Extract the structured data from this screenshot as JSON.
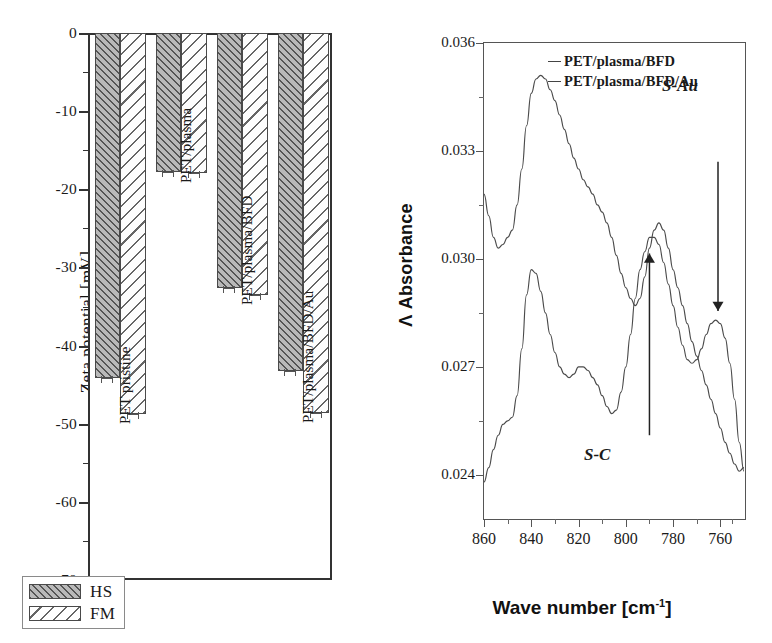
{
  "figure": {
    "panels": [
      "zeta-potential-bar-chart",
      "ftir-absorbance-spectrum"
    ]
  },
  "left_chart": {
    "ylabel": "Zeta potential [mV]",
    "ytick_labels": [
      "0",
      "-10",
      "-20",
      "-30",
      "-40",
      "-50",
      "-60",
      "-70"
    ],
    "legend": [
      {
        "key": "HS",
        "label": "HS",
        "hatch": "dense-45"
      },
      {
        "key": "FM",
        "label": "FM",
        "hatch": "sparse-135"
      }
    ],
    "categories": [
      "PET pristine",
      "PET/plasma",
      "PET/plasma/BFD",
      "PET/plasma/BFD/Au"
    ]
  },
  "right_chart": {
    "ylabel": "Λ Absorbance",
    "xlabel_main": "Wave number [cm",
    "xlabel_sup": "-1",
    "xlabel_tail": "]",
    "ytick_labels": [
      "0.036",
      "0.033",
      "0.030",
      "0.027",
      "0.024"
    ],
    "xtick_labels": [
      "860",
      "840",
      "820",
      "800",
      "780",
      "760"
    ],
    "legend": [
      {
        "label": "PET/plasma/BFD",
        "color": "#4a4a4a"
      },
      {
        "label": "PET/plasma/BFD/Au",
        "color": "#4a4a4a"
      }
    ],
    "annotations": [
      {
        "name": "s-au",
        "text": "S-Au",
        "direction": "down"
      },
      {
        "name": "s-c",
        "text": "S-C",
        "direction": "up"
      }
    ]
  },
  "chart_data": [
    {
      "type": "bar",
      "id": "zeta-potential",
      "title": "",
      "xlabel": "",
      "ylabel": "Zeta potential [mV]",
      "ylim": [
        -70,
        0
      ],
      "ytick_values": [
        0,
        -10,
        -20,
        -30,
        -40,
        -50,
        -60,
        -70
      ],
      "yminor_step": 5,
      "grid": false,
      "legend_position": "lower-left",
      "categories": [
        "PET pristine",
        "PET/plasma",
        "PET/plasma/BFD",
        "PET/plasma/BFD/Au"
      ],
      "series": [
        {
          "name": "HS",
          "values": [
            -44.2,
            -17.8,
            -32.6,
            -43.3
          ],
          "errors": [
            0.7,
            0.4,
            0.6,
            0.6
          ],
          "fill": "#b9b9b9",
          "hatch": "dense-45"
        },
        {
          "name": "FM",
          "values": [
            -48.8,
            -17.9,
            -33.5,
            -48.6
          ],
          "errors": [
            0.8,
            0.4,
            0.7,
            0.7
          ],
          "fill": "#ffffff",
          "hatch": "sparse-135"
        }
      ]
    },
    {
      "type": "line",
      "id": "ftir-absorbance",
      "title": "",
      "xlabel": "Wave number [cm-1]",
      "ylabel": "Λ Absorbance",
      "xlim": [
        860,
        750
      ],
      "x_reversed": true,
      "ylim": [
        0.0228,
        0.036
      ],
      "ytick_values": [
        0.036,
        0.033,
        0.03,
        0.027,
        0.024
      ],
      "xtick_values": [
        860,
        840,
        820,
        800,
        780,
        760
      ],
      "grid": false,
      "legend_position": "top-right-inside",
      "annotations": [
        {
          "text": "S-C",
          "x": 790,
          "y": 0.0303,
          "arrow": "up"
        },
        {
          "text": "S-Au",
          "x": 761,
          "y": 0.0282,
          "arrow": "down"
        }
      ],
      "series": [
        {
          "name": "PET/plasma/BFD",
          "color": "#4a4a4a",
          "x": [
            860,
            858,
            856,
            854,
            852,
            850,
            848,
            846,
            844,
            842,
            840,
            838,
            836,
            834,
            832,
            830,
            828,
            826,
            824,
            822,
            820,
            818,
            816,
            814,
            812,
            810,
            808,
            806,
            804,
            802,
            800,
            798,
            796,
            794,
            792,
            790,
            788,
            786,
            784,
            782,
            780,
            778,
            776,
            774,
            772,
            770,
            768,
            766,
            764,
            762,
            760,
            758,
            756,
            754,
            752,
            750
          ],
          "y": [
            0.0318,
            0.0312,
            0.0306,
            0.0303,
            0.0304,
            0.0306,
            0.0308,
            0.0315,
            0.0325,
            0.0337,
            0.0346,
            0.035,
            0.0351,
            0.035,
            0.0347,
            0.0344,
            0.034,
            0.0336,
            0.0332,
            0.0328,
            0.0325,
            0.0322,
            0.032,
            0.0318,
            0.0315,
            0.0313,
            0.031,
            0.0306,
            0.0301,
            0.0296,
            0.0292,
            0.0289,
            0.0287,
            0.0289,
            0.0295,
            0.0303,
            0.0308,
            0.031,
            0.0308,
            0.0303,
            0.0297,
            0.0292,
            0.0287,
            0.0282,
            0.0277,
            0.0273,
            0.0269,
            0.0265,
            0.0261,
            0.0257,
            0.0253,
            0.0249,
            0.0246,
            0.0243,
            0.0241,
            0.0242
          ]
        },
        {
          "name": "PET/plasma/BFD/Au",
          "color": "#4a4a4a",
          "x": [
            860,
            858,
            856,
            854,
            852,
            850,
            848,
            846,
            844,
            842,
            840,
            838,
            836,
            834,
            832,
            830,
            828,
            826,
            824,
            822,
            820,
            818,
            816,
            814,
            812,
            810,
            808,
            806,
            804,
            802,
            800,
            798,
            796,
            794,
            792,
            790,
            788,
            786,
            784,
            782,
            780,
            778,
            776,
            774,
            772,
            770,
            768,
            766,
            764,
            762,
            760,
            758,
            756,
            754,
            752,
            750
          ],
          "y": [
            0.0238,
            0.0242,
            0.0247,
            0.0251,
            0.0254,
            0.0255,
            0.0256,
            0.0262,
            0.0275,
            0.029,
            0.0297,
            0.0296,
            0.0291,
            0.0285,
            0.0279,
            0.0274,
            0.027,
            0.0268,
            0.0267,
            0.0268,
            0.027,
            0.027,
            0.0269,
            0.0267,
            0.0265,
            0.0262,
            0.0259,
            0.0257,
            0.0258,
            0.0263,
            0.027,
            0.0279,
            0.0289,
            0.0297,
            0.0302,
            0.0306,
            0.0306,
            0.0304,
            0.0299,
            0.0293,
            0.0287,
            0.0281,
            0.0276,
            0.0272,
            0.0271,
            0.0272,
            0.0275,
            0.0279,
            0.0282,
            0.0283,
            0.0282,
            0.0278,
            0.0271,
            0.0261,
            0.0249,
            0.0241
          ]
        }
      ]
    }
  ]
}
